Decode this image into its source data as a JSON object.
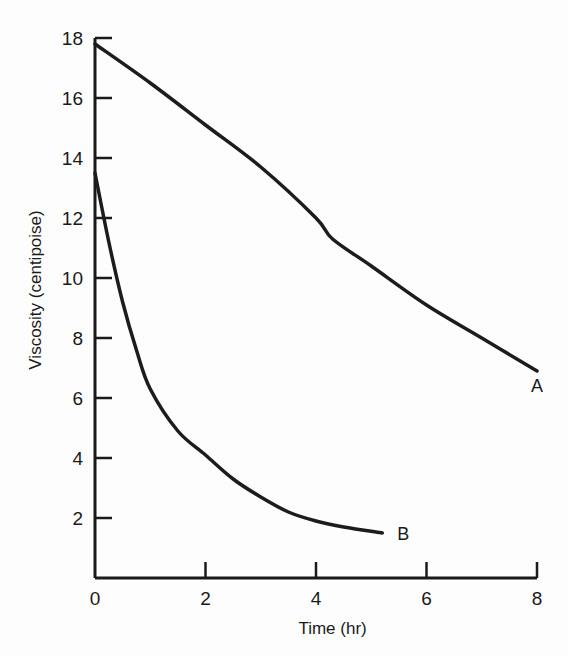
{
  "chart_data": {
    "type": "line",
    "title": "",
    "xlabel": "Time (hr)",
    "ylabel": "Viscosity (centipoise)",
    "xlim": [
      0,
      8
    ],
    "ylim": [
      0,
      18
    ],
    "x_ticks": [
      "0",
      "2",
      "4",
      "6",
      "8"
    ],
    "y_ticks": [
      "2",
      "4",
      "6",
      "8",
      "10",
      "12",
      "14",
      "16",
      "18"
    ],
    "grid": false,
    "legend": "none (curves labeled directly at their ends)",
    "series": [
      {
        "name": "A",
        "x": [
          0,
          1,
          2,
          3,
          4,
          4.3,
          5,
          6,
          7,
          8
        ],
        "y": [
          17.8,
          16.5,
          15.1,
          13.7,
          12.0,
          11.3,
          10.4,
          9.1,
          8.0,
          6.9
        ]
      },
      {
        "name": "B",
        "x": [
          0,
          0.25,
          0.5,
          0.75,
          1.0,
          1.5,
          2.0,
          2.5,
          3.0,
          3.5,
          4.0,
          4.5,
          5.2
        ],
        "y": [
          13.5,
          11.2,
          9.2,
          7.6,
          6.3,
          4.9,
          4.1,
          3.3,
          2.7,
          2.2,
          1.9,
          1.7,
          1.5
        ]
      }
    ]
  }
}
